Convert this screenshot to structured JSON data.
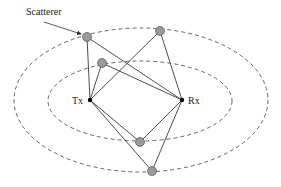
{
  "diagram": {
    "labels": {
      "scatterer": "Scatterer",
      "tx": "Tx",
      "rx": "Rx"
    },
    "colors": {
      "line": "#3a3a3a",
      "ellipse": "#555555",
      "scatterer_fill": "#9a9a9a",
      "node_fill": "#000000"
    },
    "nodes": {
      "tx": {
        "x": 90,
        "y": 100
      },
      "rx": {
        "x": 182,
        "y": 100
      }
    },
    "scatterers": [
      {
        "id": "s1",
        "x": 87,
        "y": 37
      },
      {
        "id": "s2",
        "x": 160,
        "y": 31
      },
      {
        "id": "s3",
        "x": 102,
        "y": 63
      },
      {
        "id": "s4",
        "x": 140,
        "y": 142
      },
      {
        "id": "s5",
        "x": 152,
        "y": 171
      }
    ],
    "ellipses": [
      {
        "id": "inner",
        "cx": 140,
        "cy": 101,
        "rx": 92,
        "ry": 40
      },
      {
        "id": "outer",
        "cx": 141,
        "cy": 100,
        "rx": 127,
        "ry": 72
      }
    ]
  }
}
